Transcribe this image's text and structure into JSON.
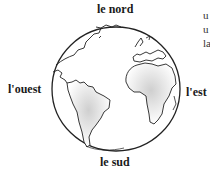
{
  "labels": {
    "north": "le nord",
    "south": "le sud",
    "west": "l'ouest",
    "east": "l'est"
  },
  "side_text_fragments": [
    "u",
    "u",
    "la"
  ],
  "globe": {
    "description": "line drawing of Earth showing the Americas, Africa and Europe",
    "stroke_color": "#222222",
    "shading_color": "#d8d8d8"
  }
}
